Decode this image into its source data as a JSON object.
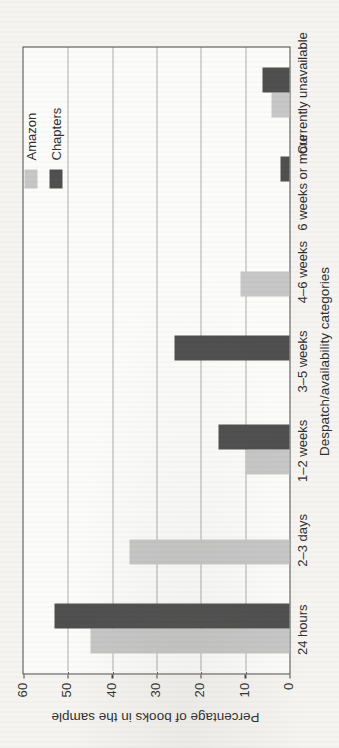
{
  "page": {
    "background": "#f5f4f1",
    "figure_rotation_deg": -90
  },
  "chart_data": {
    "type": "bar",
    "title": "",
    "xlabel": "Despatch/availability categories",
    "ylabel": "Percentage of books in the sample",
    "categories": [
      "24 hours",
      "2–3 days",
      "1–2 weeks",
      "3–5 weeks",
      "4–6 weeks",
      "6 weeks or more",
      "Currently unavailable"
    ],
    "series": [
      {
        "name": "Amazon",
        "color": "#c6c6c6",
        "values": [
          45,
          36,
          10,
          0,
          11,
          0,
          4
        ]
      },
      {
        "name": "Chapters",
        "color": "#4d4d4d",
        "values": [
          53,
          0,
          16,
          26,
          0,
          2,
          6
        ]
      }
    ],
    "ylim": [
      0,
      60
    ],
    "yticks": [
      0,
      10,
      20,
      30,
      40,
      50,
      60
    ],
    "gridlines": [
      10,
      20,
      30,
      40,
      50
    ],
    "grid_style": "dotted",
    "legend_position": "top-right-inside-plot",
    "axis_color": "#454545",
    "plot_background": "#fcfcfb"
  }
}
